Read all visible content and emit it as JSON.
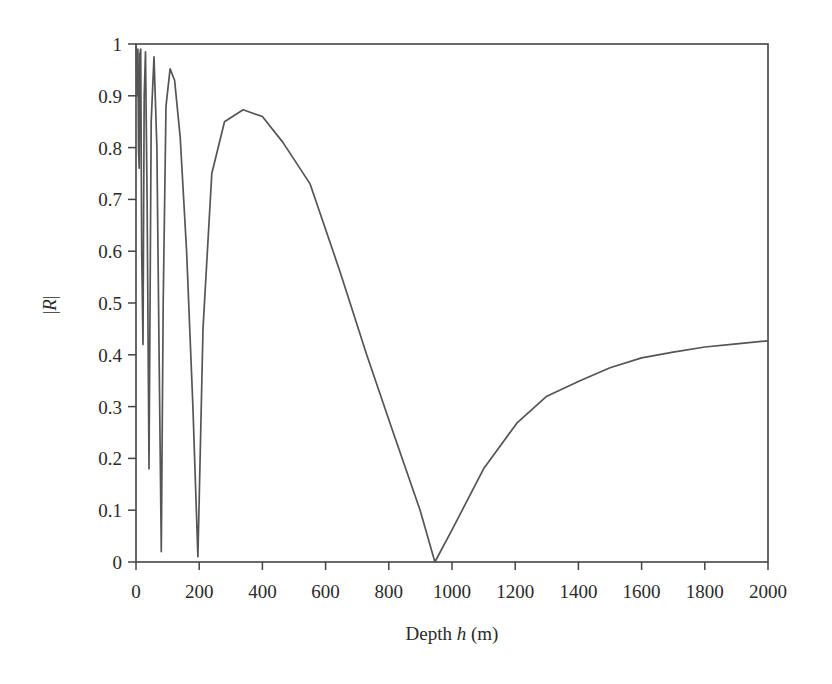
{
  "chart_data": {
    "type": "line",
    "title": "",
    "xlabel": "Depth h (m)",
    "xlabel_parts": {
      "prefix": "Depth ",
      "italic": "h",
      "suffix": " (m)"
    },
    "ylabel": "|R|",
    "ylabel_parts": {
      "prefix": "|",
      "italic": "R",
      "suffix": "|"
    },
    "xlim": [
      0,
      2000
    ],
    "ylim": [
      0,
      1
    ],
    "grid": false,
    "legend": null,
    "x_ticks": [
      "0",
      "200",
      "400",
      "600",
      "800",
      "1000",
      "1200",
      "1400",
      "1600",
      "1800",
      "2000"
    ],
    "y_ticks": [
      "0",
      "0.1",
      "0.2",
      "0.3",
      "0.4",
      "0.5",
      "0.6",
      "0.7",
      "0.8",
      "0.9",
      "1"
    ],
    "series": [
      {
        "name": "|R|",
        "color": "#555555",
        "x": [
          0,
          3,
          6,
          8,
          10,
          12,
          15,
          18,
          22,
          26,
          30,
          35,
          41,
          48,
          57,
          66,
          73,
          80,
          86,
          95,
          108,
          122,
          140,
          160,
          180,
          196,
          200,
          212,
          240,
          280,
          339,
          400,
          465,
          551,
          646,
          730,
          814,
          899,
          946,
          1000,
          1100,
          1205,
          1300,
          1405,
          1500,
          1600,
          1700,
          1800,
          1900,
          2000
        ],
        "y": [
          1.0,
          0.9,
          0.99,
          0.8,
          0.76,
          0.98,
          0.99,
          0.6,
          0.42,
          0.9,
          0.985,
          0.7,
          0.18,
          0.85,
          0.975,
          0.8,
          0.4,
          0.02,
          0.5,
          0.88,
          0.952,
          0.93,
          0.82,
          0.6,
          0.3,
          0.01,
          0.12,
          0.45,
          0.75,
          0.85,
          0.873,
          0.86,
          0.81,
          0.73,
          0.56,
          0.4,
          0.25,
          0.1,
          0.0,
          0.062,
          0.18,
          0.268,
          0.32,
          0.35,
          0.375,
          0.394,
          0.405,
          0.415,
          0.421,
          0.427
        ]
      }
    ]
  }
}
